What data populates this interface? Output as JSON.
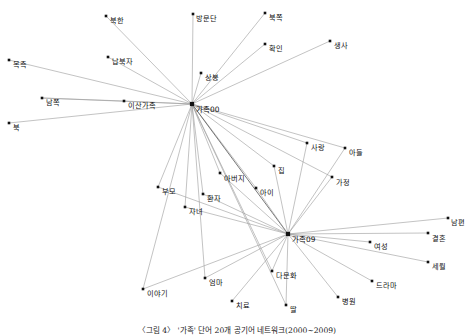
{
  "figure": {
    "caption": "〈그림 4〉 '가족' 단어 20개 공기어 네트워크(2000~2009)",
    "width": 474,
    "height": 336,
    "background": "#ffffff",
    "edge_color": "#9a9a9a",
    "node_color": "#111111"
  },
  "chart_data": {
    "type": "network",
    "title": "〈그림 4〉 '가족' 단어 20개 공기어 네트워크(2000~2009)",
    "layout": "force-directed",
    "directed": false,
    "hubs": [
      "가족00",
      "가족09"
    ],
    "nodes": [
      {
        "id": "북한",
        "label": "북한",
        "x": 106,
        "y": 16,
        "lx": 110,
        "ly": 17,
        "hub": false
      },
      {
        "id": "방문단",
        "label": "방문단",
        "x": 193,
        "y": 14,
        "lx": 196,
        "ly": 15,
        "hub": false
      },
      {
        "id": "북쪽",
        "label": "북쪽",
        "x": 265,
        "y": 13,
        "lx": 269,
        "ly": 14,
        "hub": false
      },
      {
        "id": "확인",
        "label": "확인",
        "x": 265,
        "y": 44,
        "lx": 269,
        "ly": 45,
        "hub": false
      },
      {
        "id": "생사",
        "label": "생사",
        "x": 330,
        "y": 41,
        "lx": 334,
        "ly": 42,
        "hub": false
      },
      {
        "id": "상봉",
        "label": "상봉",
        "x": 201,
        "y": 73,
        "lx": 205,
        "ly": 74,
        "hub": false
      },
      {
        "id": "납북자",
        "label": "납북자",
        "x": 108,
        "y": 57,
        "lx": 112,
        "ly": 58,
        "hub": false
      },
      {
        "id": "목측",
        "label": "목측",
        "x": 9,
        "y": 60,
        "lx": 13,
        "ly": 61,
        "hub": false
      },
      {
        "id": "남쪽",
        "label": "남쪽",
        "x": 42,
        "y": 98,
        "lx": 46,
        "ly": 99,
        "hub": false
      },
      {
        "id": "이산가족",
        "label": "이산가족",
        "x": 124,
        "y": 101,
        "lx": 128,
        "ly": 102,
        "hub": false
      },
      {
        "id": "북",
        "label": "북",
        "x": 9,
        "y": 123,
        "lx": 13,
        "ly": 124,
        "hub": false
      },
      {
        "id": "가족00",
        "label": "가족00",
        "x": 192,
        "y": 104,
        "lx": 196,
        "ly": 106,
        "hub": true
      },
      {
        "id": "사랑",
        "label": "사랑",
        "x": 307,
        "y": 143,
        "lx": 311,
        "ly": 144,
        "hub": false
      },
      {
        "id": "아들",
        "label": "아들",
        "x": 345,
        "y": 148,
        "lx": 349,
        "ly": 149,
        "hub": false
      },
      {
        "id": "가정",
        "label": "가정",
        "x": 332,
        "y": 177,
        "lx": 336,
        "ly": 179,
        "hub": false
      },
      {
        "id": "집",
        "label": "집",
        "x": 274,
        "y": 166,
        "lx": 278,
        "ly": 167,
        "hub": false
      },
      {
        "id": "아버지",
        "label": "아버지",
        "x": 220,
        "y": 173,
        "lx": 224,
        "ly": 175,
        "hub": false
      },
      {
        "id": "아이",
        "label": "아이",
        "x": 256,
        "y": 188,
        "lx": 260,
        "ly": 189,
        "hub": false
      },
      {
        "id": "부모",
        "label": "부모",
        "x": 158,
        "y": 187,
        "lx": 162,
        "ly": 188,
        "hub": false
      },
      {
        "id": "환자",
        "label": "환자",
        "x": 203,
        "y": 194,
        "lx": 207,
        "ly": 195,
        "hub": false
      },
      {
        "id": "자녀",
        "label": "자녀",
        "x": 185,
        "y": 207,
        "lx": 189,
        "ly": 208,
        "hub": false
      },
      {
        "id": "남편",
        "label": "남편",
        "x": 448,
        "y": 218,
        "lx": 451,
        "ly": 219,
        "hub": false
      },
      {
        "id": "가족09",
        "label": "가족09",
        "x": 288,
        "y": 234,
        "lx": 292,
        "ly": 236,
        "hub": true
      },
      {
        "id": "결혼",
        "label": "결혼",
        "x": 428,
        "y": 233,
        "lx": 432,
        "ly": 235,
        "hub": false
      },
      {
        "id": "여성",
        "label": "여성",
        "x": 370,
        "y": 242,
        "lx": 374,
        "ly": 243,
        "hub": false
      },
      {
        "id": "세월",
        "label": "세월",
        "x": 428,
        "y": 262,
        "lx": 432,
        "ly": 263,
        "hub": false
      },
      {
        "id": "다문화",
        "label": "다문화",
        "x": 272,
        "y": 271,
        "lx": 276,
        "ly": 272,
        "hub": false
      },
      {
        "id": "드라마",
        "label": "드라마",
        "x": 372,
        "y": 281,
        "lx": 376,
        "ly": 282,
        "hub": false
      },
      {
        "id": "엄마",
        "label": "엄마",
        "x": 205,
        "y": 278,
        "lx": 209,
        "ly": 279,
        "hub": false
      },
      {
        "id": "이야기",
        "label": "이야기",
        "x": 143,
        "y": 289,
        "lx": 147,
        "ly": 290,
        "hub": false
      },
      {
        "id": "병원",
        "label": "병원",
        "x": 338,
        "y": 297,
        "lx": 342,
        "ly": 298,
        "hub": false
      },
      {
        "id": "치료",
        "label": "치료",
        "x": 232,
        "y": 301,
        "lx": 236,
        "ly": 302,
        "hub": false
      },
      {
        "id": "딸",
        "label": "딸",
        "x": 286,
        "y": 305,
        "lx": 290,
        "ly": 306,
        "hub": false
      }
    ],
    "edges": [
      {
        "source": "가족00",
        "target": "북한"
      },
      {
        "source": "가족00",
        "target": "방문단"
      },
      {
        "source": "가족00",
        "target": "북쪽"
      },
      {
        "source": "가족00",
        "target": "확인"
      },
      {
        "source": "가족00",
        "target": "생사"
      },
      {
        "source": "가족00",
        "target": "상봉"
      },
      {
        "source": "가족00",
        "target": "납북자"
      },
      {
        "source": "가족00",
        "target": "목측"
      },
      {
        "source": "가족00",
        "target": "남쪽"
      },
      {
        "source": "가족00",
        "target": "이산가족"
      },
      {
        "source": "가족00",
        "target": "북"
      },
      {
        "source": "가족00",
        "target": "사랑"
      },
      {
        "source": "가족00",
        "target": "아들"
      },
      {
        "source": "가족00",
        "target": "가정"
      },
      {
        "source": "가족00",
        "target": "집"
      },
      {
        "source": "가족00",
        "target": "아버지"
      },
      {
        "source": "가족00",
        "target": "아이"
      },
      {
        "source": "가족00",
        "target": "부모"
      },
      {
        "source": "가족00",
        "target": "환자"
      },
      {
        "source": "가족00",
        "target": "자녀"
      },
      {
        "source": "가족00",
        "target": "가족09"
      },
      {
        "source": "가족00",
        "target": "다문화"
      },
      {
        "source": "가족00",
        "target": "엄마"
      },
      {
        "source": "가족00",
        "target": "이야기"
      },
      {
        "source": "가족00",
        "target": "딸"
      },
      {
        "source": "가족09",
        "target": "사랑"
      },
      {
        "source": "가족09",
        "target": "아들"
      },
      {
        "source": "가족09",
        "target": "가정"
      },
      {
        "source": "가족09",
        "target": "집"
      },
      {
        "source": "가족09",
        "target": "아버지"
      },
      {
        "source": "가족09",
        "target": "아이"
      },
      {
        "source": "가족09",
        "target": "부모"
      },
      {
        "source": "가족09",
        "target": "환자"
      },
      {
        "source": "가족09",
        "target": "자녀"
      },
      {
        "source": "가족09",
        "target": "남편"
      },
      {
        "source": "가족09",
        "target": "결혼"
      },
      {
        "source": "가족09",
        "target": "여성"
      },
      {
        "source": "가족09",
        "target": "세월"
      },
      {
        "source": "가족09",
        "target": "다문화"
      },
      {
        "source": "가족09",
        "target": "드라마"
      },
      {
        "source": "가족09",
        "target": "엄마"
      },
      {
        "source": "가족09",
        "target": "이야기"
      },
      {
        "source": "가족09",
        "target": "병원"
      },
      {
        "source": "가족09",
        "target": "치료"
      },
      {
        "source": "가족09",
        "target": "딸"
      },
      {
        "source": "이산가족",
        "target": "남쪽"
      }
    ],
    "node_count": 33,
    "edge_count": 46
  }
}
